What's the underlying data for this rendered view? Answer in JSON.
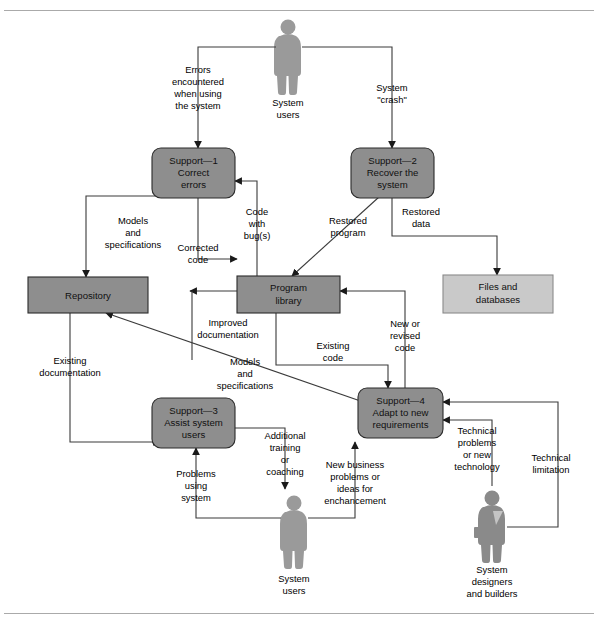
{
  "figure": {
    "caption_text": ""
  },
  "processes": [
    {
      "id": "support-1",
      "lines": [
        "Support—1",
        "Correct",
        "errors"
      ],
      "fill": "#8e8e8e"
    },
    {
      "id": "support-2",
      "lines": [
        "Support—2",
        "Recover the",
        "system"
      ],
      "fill": "#8e8e8e"
    },
    {
      "id": "support-3",
      "lines": [
        "Support—3",
        "Assist system",
        "users"
      ],
      "fill": "#8e8e8e"
    },
    {
      "id": "support-4",
      "lines": [
        "Support—4",
        "Adapt to new",
        "requirements"
      ],
      "fill": "#8e8e8e"
    }
  ],
  "stores": [
    {
      "id": "repository",
      "lines": [
        "Repository"
      ],
      "fill": "#8e8e8e"
    },
    {
      "id": "program-library",
      "lines": [
        "Program",
        "library"
      ],
      "fill": "#8e8e8e"
    },
    {
      "id": "files-databases",
      "lines": [
        "Files and",
        "databases"
      ],
      "fill": "#c9c9c9"
    }
  ],
  "actors": [
    {
      "id": "system-users-top",
      "lines": [
        "System",
        "users"
      ]
    },
    {
      "id": "system-users-bottom",
      "lines": [
        "System",
        "users"
      ]
    },
    {
      "id": "system-designers",
      "lines": [
        "System",
        "designers",
        "and builders"
      ]
    }
  ],
  "flows": [
    {
      "id": "errors-encountered",
      "lines": [
        "Errors",
        "encountered",
        "when using",
        "the system"
      ]
    },
    {
      "id": "system-crash",
      "lines": [
        "System",
        "\"crash\""
      ]
    },
    {
      "id": "models-and-specs-left",
      "lines": [
        "Models",
        "and",
        "specifications"
      ]
    },
    {
      "id": "corrected-code",
      "lines": [
        "Corrected",
        "code"
      ]
    },
    {
      "id": "code-with-bugs",
      "lines": [
        "Code",
        "with",
        "bug(s)"
      ]
    },
    {
      "id": "restored-program",
      "lines": [
        "Restored",
        "program"
      ]
    },
    {
      "id": "restored-data",
      "lines": [
        "Restored",
        "data"
      ]
    },
    {
      "id": "improved-documentation",
      "lines": [
        "Improved",
        "documentation"
      ]
    },
    {
      "id": "existing-documentation",
      "lines": [
        "Existing",
        "documentation"
      ]
    },
    {
      "id": "models-and-specs-diag",
      "lines": [
        "Models",
        "and",
        "specifications"
      ]
    },
    {
      "id": "existing-code",
      "lines": [
        "Existing",
        "code"
      ]
    },
    {
      "id": "new-or-revised-code",
      "lines": [
        "New or",
        "revised",
        "code"
      ]
    },
    {
      "id": "additional-training",
      "lines": [
        "Additional",
        "training",
        "or",
        "coaching"
      ]
    },
    {
      "id": "problems-using-system",
      "lines": [
        "Problems",
        "using",
        "system"
      ]
    },
    {
      "id": "new-business-problems",
      "lines": [
        "New business",
        "problems or",
        "ideas for",
        "enchancement"
      ]
    },
    {
      "id": "technical-problems",
      "lines": [
        "Technical",
        "problems",
        "or new",
        "technology"
      ]
    },
    {
      "id": "technical-limitation",
      "lines": [
        "Technical",
        "limitation"
      ]
    }
  ],
  "colors": {
    "process_fill": "#8e8e8e",
    "store_light_fill": "#c9c9c9",
    "actor_fill": "#9a9a9a",
    "line": "#3a3a3a",
    "rule": "#aaaaaa"
  }
}
